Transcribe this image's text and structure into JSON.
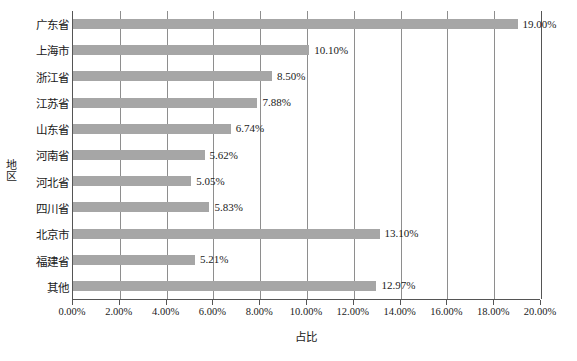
{
  "chart_data": {
    "type": "bar",
    "orientation": "horizontal",
    "title": "",
    "xlabel": "占比",
    "ylabel": "地区",
    "categories": [
      "广东省",
      "上海市",
      "浙江省",
      "江苏省",
      "山东省",
      "河南省",
      "河北省",
      "四川省",
      "北京市",
      "福建省",
      "其他"
    ],
    "values": [
      19.0,
      10.1,
      8.5,
      7.88,
      6.74,
      5.62,
      5.05,
      5.83,
      13.1,
      5.21,
      12.97
    ],
    "value_labels": [
      "19.00%",
      "10.10%",
      "8.50%",
      "7.88%",
      "6.74%",
      "5.62%",
      "5.05%",
      "5.83%",
      "13.10%",
      "5.21%",
      "12.97%"
    ],
    "xlim": [
      0,
      20
    ],
    "xtick_values": [
      0,
      2,
      4,
      6,
      8,
      10,
      12,
      14,
      16,
      18,
      20
    ],
    "xtick_labels": [
      "0.00%",
      "2.00%",
      "4.00%",
      "6.00%",
      "8.00%",
      "10.00%",
      "12.00%",
      "14.00%",
      "16.00%",
      "18.00%",
      "20.00%"
    ],
    "grid": "vertical",
    "legend": "none",
    "bar_color": "#a6a6a6",
    "axis_color": "#555555",
    "grid_color": "#8e8e8e",
    "background_color": "#ffffff"
  }
}
